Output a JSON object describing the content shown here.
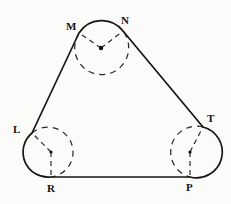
{
  "figure": {
    "background_color": "#fbfbfa",
    "stroke_color": "#151515",
    "dash_color": "#2a2a2a",
    "width": 231,
    "height": 204,
    "labels": [
      {
        "id": "M",
        "text": "M",
        "x": 66,
        "y": 21
      },
      {
        "id": "N",
        "text": "N",
        "x": 121,
        "y": 15
      },
      {
        "id": "L",
        "text": "L",
        "x": 13,
        "y": 124
      },
      {
        "id": "T",
        "text": "T",
        "x": 207,
        "y": 113
      },
      {
        "id": "R",
        "text": "R",
        "x": 47,
        "y": 183
      },
      {
        "id": "P",
        "text": "P",
        "x": 186,
        "y": 182
      }
    ],
    "circles": [
      {
        "id": "top-circle",
        "cx": 101,
        "cy": 48,
        "r": 27
      },
      {
        "id": "left-circle",
        "cx": 51,
        "cy": 152,
        "r": 25
      },
      {
        "id": "right-circle",
        "cx": 190,
        "cy": 152,
        "r": 25
      }
    ],
    "tangent_points": [
      {
        "id": "M",
        "x": 79,
        "y": 33
      },
      {
        "id": "N",
        "x": 123,
        "y": 31
      },
      {
        "id": "L",
        "x": 32,
        "y": 133
      },
      {
        "id": "R",
        "x": 51,
        "y": 177
      },
      {
        "id": "T",
        "x": 203,
        "y": 127
      },
      {
        "id": "P",
        "x": 190,
        "y": 177
      }
    ],
    "outline_path": "M 79 33 L 32 133 A 25 25 0 0 0 51 177 L 190 177 A 25 25 0 0 0 203 127 L 123 31 A 27 27 0 0 0 79 33 Z",
    "dashed_arcs": [
      "M 79 33 A 27 27 0 1 0 123 31",
      "M 32 133 A 25 25 0 1 1 51 177",
      "M 203 127 A 25 25 0 1 0 190 177"
    ],
    "dashed_radii": [
      {
        "from": "top-center",
        "x1": 101,
        "y1": 48,
        "x2": 79,
        "y2": 33
      },
      {
        "from": "top-center",
        "x1": 101,
        "y1": 48,
        "x2": 123,
        "y2": 31
      },
      {
        "from": "left-center",
        "x1": 51,
        "y1": 152,
        "x2": 32,
        "y2": 133
      },
      {
        "from": "left-center",
        "x1": 51,
        "y1": 152,
        "x2": 51,
        "y2": 177
      },
      {
        "from": "right-center",
        "x1": 190,
        "y1": 152,
        "x2": 203,
        "y2": 127
      },
      {
        "from": "right-center",
        "x1": 190,
        "y1": 152,
        "x2": 190,
        "y2": 177
      }
    ]
  }
}
